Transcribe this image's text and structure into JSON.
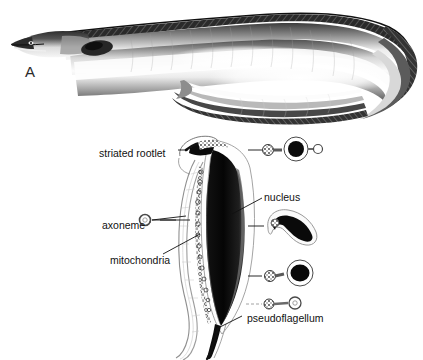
{
  "figure": {
    "background_color": "#ffffff",
    "ink_color": "#111111",
    "width": 423,
    "height": 360
  },
  "panels": [
    {
      "letter": "A",
      "name": "eel-photograph",
      "subject": "eel",
      "description": "Halftone photographic illustration of an elongate eel, head at upper left with pointed snout, body curving into a U-shaped loop at the right; dark hatched dorsal and anal fin margins, pale silvery belly.",
      "media": "halftone photograph"
    },
    {
      "letter": "B",
      "name": "spermatozoon-diagram",
      "subject": "spermatozoon ultrastructure",
      "description": "Line drawing of an elongate spermatozoon in longitudinal view with four transverse-section insets arranged down the right side.",
      "media": "line drawing"
    }
  ],
  "labels": [
    {
      "id": "striated-rootlet",
      "text": "striated rootlet",
      "leader": "right"
    },
    {
      "id": "nucleus",
      "text": "nucleus",
      "leader": "left"
    },
    {
      "id": "axoneme",
      "text": "axoneme",
      "leader": "right"
    },
    {
      "id": "mitochondria",
      "text": "mitochondria",
      "leader": "right"
    },
    {
      "id": "pseudoflagellum",
      "text": "pseudoflagellum",
      "leader": "up"
    }
  ],
  "structures": {
    "nucleus": "elongate, densely stippled dark body occupying the right side of the cell",
    "striated_rootlet": "short dark wedge at the anterior (top) tip of the cell",
    "axoneme": "pale slender filament running down the left side and trailing free below",
    "mitochondria": "row of small granular circles between axoneme and nucleus",
    "pseudoflagellum": "tapering dark posterior extension at the bottom of the cell"
  },
  "insets": [
    {
      "id": "inset-1",
      "name": "transverse-section-anterior",
      "description": "small ring, large circle with solid dark nucleus, small ring at right"
    },
    {
      "id": "inset-2",
      "name": "transverse-section-midpiece",
      "description": "crescent / banana-shaped dark nucleus within a pale outline"
    },
    {
      "id": "inset-3",
      "name": "transverse-section-posterior",
      "description": "small stippled ring joined to a large circle with solid dark nucleus"
    },
    {
      "id": "inset-4",
      "name": "transverse-section-tail",
      "description": "two small rings joined by a narrow bridge"
    }
  ]
}
